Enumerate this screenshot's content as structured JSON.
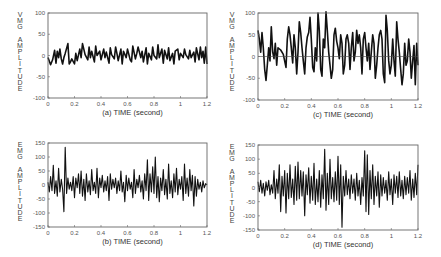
{
  "chart_data": [
    {
      "id": "a",
      "type": "line",
      "panel_label": "(a)",
      "xlabel": "TIME (second)",
      "ylabel": "VMG AMPLITUDE",
      "xlim": [
        0,
        1.2
      ],
      "ylim": [
        -100,
        100
      ],
      "xticks": [
        "0",
        "0.2",
        "0.4",
        "0.6",
        "0.8",
        "1",
        "1.2"
      ],
      "yticks": [
        "100",
        "50",
        "0",
        "-50",
        "-100"
      ],
      "zero_line": false,
      "grid": false,
      "frame": {
        "x": 48,
        "y": 13,
        "w": 159,
        "h": 85
      },
      "stroke_width": 1.6,
      "x": [
        0,
        0.02,
        0.035,
        0.05,
        0.06,
        0.07,
        0.08,
        0.09,
        0.1,
        0.11,
        0.12,
        0.13,
        0.15,
        0.16,
        0.17,
        0.18,
        0.2,
        0.21,
        0.22,
        0.24,
        0.25,
        0.26,
        0.28,
        0.3,
        0.31,
        0.32,
        0.33,
        0.35,
        0.36,
        0.37,
        0.39,
        0.4,
        0.42,
        0.43,
        0.44,
        0.46,
        0.47,
        0.48,
        0.5,
        0.51,
        0.52,
        0.53,
        0.55,
        0.56,
        0.57,
        0.59,
        0.6,
        0.62,
        0.63,
        0.64,
        0.66,
        0.67,
        0.68,
        0.7,
        0.71,
        0.72,
        0.74,
        0.75,
        0.76,
        0.78,
        0.79,
        0.8,
        0.82,
        0.83,
        0.84,
        0.86,
        0.87,
        0.88,
        0.9,
        0.91,
        0.92,
        0.94,
        0.95,
        0.96,
        0.98,
        0.99,
        1.0,
        1.02,
        1.03,
        1.04,
        1.06,
        1.07,
        1.08,
        1.1,
        1.11,
        1.12,
        1.14,
        1.15,
        1.16,
        1.17,
        1.18,
        1.19,
        1.2
      ],
      "values": [
        -5,
        -22,
        -10,
        12,
        -18,
        10,
        -5,
        15,
        -8,
        -20,
        -5,
        5,
        28,
        -20,
        -15,
        -8,
        -20,
        5,
        -12,
        15,
        -5,
        28,
        2,
        -10,
        20,
        -5,
        10,
        -15,
        22,
        0,
        10,
        -10,
        15,
        -5,
        8,
        -18,
        18,
        2,
        -8,
        20,
        5,
        -12,
        15,
        -20,
        10,
        -5,
        15,
        -10,
        -15,
        22,
        -8,
        5,
        20,
        -5,
        10,
        -15,
        18,
        -20,
        5,
        -10,
        20,
        0,
        -8,
        25,
        -5,
        15,
        -18,
        12,
        -8,
        18,
        -12,
        5,
        -20,
        10,
        15,
        -10,
        5,
        -5,
        15,
        2,
        -8,
        12,
        -5,
        8,
        -15,
        18,
        -10,
        20,
        -5,
        10,
        -18,
        20,
        -20
      ]
    },
    {
      "id": "c",
      "type": "line",
      "panel_label": "(c)",
      "xlabel": "TIME (second)",
      "ylabel": "VMG AMPLITUDE",
      "xlim": [
        0,
        1.2
      ],
      "ylim": [
        -100,
        100
      ],
      "xticks": [
        "0",
        "0.2",
        "0.4",
        "0.6",
        "0.8",
        "1",
        "1.2"
      ],
      "yticks": [
        "100",
        "50",
        "0",
        "-50",
        "-100"
      ],
      "zero_line": true,
      "grid": false,
      "frame": {
        "x": 258,
        "y": 13,
        "w": 160,
        "h": 87
      },
      "stroke_width": 1.6,
      "x": [
        0,
        0.01,
        0.02,
        0.03,
        0.04,
        0.05,
        0.06,
        0.07,
        0.08,
        0.09,
        0.1,
        0.11,
        0.12,
        0.13,
        0.14,
        0.15,
        0.17,
        0.19,
        0.21,
        0.22,
        0.23,
        0.24,
        0.25,
        0.26,
        0.27,
        0.28,
        0.29,
        0.3,
        0.31,
        0.32,
        0.33,
        0.34,
        0.35,
        0.36,
        0.37,
        0.38,
        0.39,
        0.4,
        0.41,
        0.42,
        0.43,
        0.44,
        0.45,
        0.46,
        0.47,
        0.48,
        0.49,
        0.5,
        0.51,
        0.52,
        0.53,
        0.54,
        0.55,
        0.56,
        0.57,
        0.58,
        0.59,
        0.6,
        0.61,
        0.62,
        0.63,
        0.64,
        0.65,
        0.66,
        0.67,
        0.68,
        0.69,
        0.7,
        0.71,
        0.72,
        0.73,
        0.74,
        0.75,
        0.76,
        0.77,
        0.78,
        0.79,
        0.8,
        0.81,
        0.82,
        0.83,
        0.84,
        0.85,
        0.86,
        0.87,
        0.88,
        0.89,
        0.9,
        0.91,
        0.92,
        0.93,
        0.94,
        0.95,
        0.96,
        0.97,
        0.98,
        0.99,
        1.0,
        1.01,
        1.02,
        1.03,
        1.04,
        1.05,
        1.06,
        1.07,
        1.08,
        1.09,
        1.1,
        1.11,
        1.12,
        1.13,
        1.14,
        1.15,
        1.16,
        1.17,
        1.18,
        1.19,
        1.2
      ],
      "values": [
        60,
        40,
        10,
        55,
        20,
        -30,
        -55,
        -20,
        20,
        -10,
        68,
        10,
        -5,
        30,
        -20,
        20,
        15,
        5,
        -25,
        40,
        68,
        50,
        20,
        -15,
        50,
        20,
        -40,
        10,
        80,
        55,
        20,
        -10,
        -40,
        20,
        45,
        55,
        90,
        40,
        -25,
        -35,
        20,
        -10,
        100,
        60,
        -30,
        -45,
        40,
        20,
        103,
        60,
        10,
        -20,
        -50,
        -30,
        50,
        65,
        35,
        20,
        -5,
        50,
        30,
        -40,
        -20,
        40,
        50,
        30,
        -30,
        20,
        55,
        -10,
        10,
        60,
        30,
        50,
        20,
        -40,
        40,
        55,
        20,
        -10,
        30,
        -30,
        10,
        50,
        30,
        -50,
        -20,
        20,
        50,
        60,
        40,
        -40,
        -60,
        95,
        60,
        -10,
        -40,
        -20,
        40,
        -10,
        -45,
        80,
        40,
        10,
        -30,
        -65,
        -40,
        30,
        -20,
        -10,
        40,
        10,
        -50,
        -10,
        25,
        -65,
        30,
        -20,
        -50,
        -10
      ]
    },
    {
      "id": "b",
      "type": "line",
      "panel_label": "(b)",
      "xlabel": "TIME (second)",
      "ylabel": "EMG AMPLITUDE",
      "xlim": [
        0,
        1.2
      ],
      "ylim": [
        -150,
        150
      ],
      "xticks": [
        "0",
        "0.2",
        "0.4",
        "0.6",
        "0.8",
        "1",
        "1.2"
      ],
      "yticks": [
        "150",
        "100",
        "50",
        "0",
        "-50",
        "-100",
        "-150"
      ],
      "zero_line": false,
      "grid": false,
      "frame": {
        "x": 48,
        "y": 143,
        "w": 159,
        "h": 84
      },
      "stroke_width": 1.1,
      "x": [
        0,
        0.01,
        0.02,
        0.03,
        0.04,
        0.05,
        0.06,
        0.07,
        0.08,
        0.09,
        0.1,
        0.11,
        0.12,
        0.13,
        0.14,
        0.15,
        0.16,
        0.17,
        0.18,
        0.19,
        0.2,
        0.21,
        0.22,
        0.23,
        0.24,
        0.25,
        0.26,
        0.27,
        0.28,
        0.29,
        0.3,
        0.31,
        0.32,
        0.33,
        0.34,
        0.35,
        0.36,
        0.37,
        0.38,
        0.39,
        0.4,
        0.41,
        0.42,
        0.43,
        0.44,
        0.45,
        0.46,
        0.47,
        0.48,
        0.49,
        0.5,
        0.51,
        0.52,
        0.53,
        0.54,
        0.55,
        0.56,
        0.57,
        0.58,
        0.59,
        0.6,
        0.61,
        0.62,
        0.63,
        0.64,
        0.65,
        0.66,
        0.67,
        0.68,
        0.69,
        0.7,
        0.71,
        0.72,
        0.73,
        0.74,
        0.75,
        0.76,
        0.77,
        0.78,
        0.79,
        0.8,
        0.81,
        0.82,
        0.83,
        0.84,
        0.85,
        0.86,
        0.87,
        0.88,
        0.89,
        0.9,
        0.91,
        0.92,
        0.93,
        0.94,
        0.95,
        0.96,
        0.97,
        0.98,
        0.99,
        1.0,
        1.01,
        1.02,
        1.03,
        1.04,
        1.05,
        1.06,
        1.07,
        1.08,
        1.09,
        1.1,
        1.11,
        1.12,
        1.13,
        1.14,
        1.15,
        1.16,
        1.17,
        1.18,
        1.19,
        1.2
      ],
      "values": [
        10,
        -25,
        30,
        -20,
        70,
        -30,
        15,
        -40,
        60,
        -25,
        20,
        -15,
        -95,
        135,
        -30,
        25,
        -15,
        10,
        -20,
        30,
        -45,
        25,
        -10,
        40,
        -30,
        50,
        -40,
        20,
        -55,
        40,
        -25,
        15,
        -35,
        55,
        -20,
        10,
        -30,
        60,
        -45,
        25,
        -10,
        35,
        -25,
        15,
        -20,
        30,
        -55,
        40,
        -15,
        20,
        -10,
        25,
        -30,
        15,
        -20,
        50,
        -25,
        10,
        -60,
        35,
        -20,
        25,
        -15,
        10,
        -45,
        55,
        -30,
        20,
        -10,
        35,
        -25,
        15,
        -50,
        40,
        -20,
        90,
        -55,
        40,
        -25,
        65,
        -30,
        100,
        -45,
        30,
        -60,
        25,
        -20,
        55,
        -35,
        20,
        -50,
        75,
        -30,
        15,
        -45,
        40,
        -25,
        60,
        -35,
        20,
        -15,
        30,
        -55,
        75,
        -30,
        25,
        -40,
        55,
        -20,
        35,
        -75,
        30,
        -40,
        20,
        -15,
        10,
        -25,
        15,
        -10,
        5,
        0,
        10,
        -5
      ]
    },
    {
      "id": "d",
      "type": "line",
      "panel_label": "(d)",
      "xlabel": "TIME (second)",
      "ylabel": "EMG AMPLITUDE",
      "xlim": [
        0,
        1.2
      ],
      "ylim": [
        -150,
        150
      ],
      "xticks": [
        "0",
        "0.2",
        "0.4",
        "0.6",
        "0.8",
        "1",
        "1.2"
      ],
      "yticks": [
        "150",
        "100",
        "50",
        "0",
        "-50",
        "-100",
        "-150"
      ],
      "zero_line": false,
      "grid": false,
      "frame": {
        "x": 258,
        "y": 145,
        "w": 160,
        "h": 85
      },
      "stroke_width": 1.1,
      "x": [
        0,
        0.01,
        0.02,
        0.03,
        0.04,
        0.05,
        0.06,
        0.07,
        0.08,
        0.09,
        0.1,
        0.11,
        0.12,
        0.13,
        0.14,
        0.15,
        0.16,
        0.17,
        0.18,
        0.19,
        0.2,
        0.21,
        0.22,
        0.23,
        0.24,
        0.25,
        0.26,
        0.27,
        0.28,
        0.29,
        0.3,
        0.31,
        0.32,
        0.33,
        0.34,
        0.35,
        0.36,
        0.37,
        0.38,
        0.39,
        0.4,
        0.41,
        0.42,
        0.43,
        0.44,
        0.45,
        0.46,
        0.47,
        0.48,
        0.49,
        0.5,
        0.51,
        0.52,
        0.53,
        0.54,
        0.55,
        0.56,
        0.57,
        0.58,
        0.59,
        0.6,
        0.61,
        0.62,
        0.63,
        0.64,
        0.65,
        0.66,
        0.67,
        0.68,
        0.69,
        0.7,
        0.71,
        0.72,
        0.73,
        0.74,
        0.75,
        0.76,
        0.77,
        0.78,
        0.79,
        0.8,
        0.81,
        0.82,
        0.83,
        0.84,
        0.85,
        0.86,
        0.87,
        0.88,
        0.89,
        0.9,
        0.91,
        0.92,
        0.93,
        0.94,
        0.95,
        0.96,
        0.97,
        0.98,
        0.99,
        1.0,
        1.01,
        1.02,
        1.03,
        1.04,
        1.05,
        1.06,
        1.07,
        1.08,
        1.09,
        1.1,
        1.11,
        1.12,
        1.13,
        1.14,
        1.15,
        1.16,
        1.17,
        1.18,
        1.19,
        1.2
      ],
      "values": [
        20,
        -15,
        25,
        -20,
        15,
        -30,
        20,
        -10,
        25,
        -25,
        10,
        -20,
        60,
        -40,
        30,
        -20,
        80,
        -85,
        40,
        -30,
        60,
        -90,
        50,
        -40,
        80,
        -35,
        30,
        -60,
        75,
        -45,
        90,
        -40,
        60,
        -30,
        55,
        -100,
        45,
        -25,
        70,
        -55,
        40,
        -45,
        85,
        -60,
        30,
        -50,
        60,
        -70,
        45,
        -40,
        135,
        -80,
        50,
        -60,
        100,
        -40,
        35,
        -50,
        55,
        -45,
        110,
        -60,
        80,
        -140,
        40,
        -30,
        60,
        -25,
        30,
        -40,
        45,
        -20,
        30,
        -45,
        50,
        -30,
        25,
        -60,
        35,
        -30,
        130,
        -85,
        115,
        -95,
        60,
        -40,
        80,
        -60,
        40,
        -30,
        55,
        -70,
        45,
        -30,
        35,
        -20,
        25,
        -45,
        55,
        -25,
        30,
        -60,
        45,
        -20,
        40,
        -35,
        55,
        -30,
        25,
        -40,
        40,
        -25,
        35,
        -20,
        60,
        -45,
        30,
        -35,
        50,
        -25,
        80,
        -70
      ]
    }
  ]
}
